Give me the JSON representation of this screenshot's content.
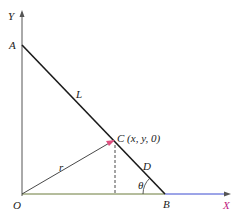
{
  "diagram": {
    "labels": {
      "y_axis": "Y",
      "x_axis": "X",
      "origin": "O",
      "point_a": "A",
      "point_b": "B",
      "point_c": "C (x, y, 0)",
      "segment_l": "L",
      "segment_d": "D",
      "vector_r": "r",
      "angle": "θ"
    },
    "colors": {
      "axis_y": "#555555",
      "axis_x_left": "#6b7a3a",
      "axis_x_right": "#3a4ad0",
      "line_ab": "#1a1a1a",
      "vector": "#333333",
      "x_label": "#c02080",
      "arrow_tip_c": "#e05080"
    }
  }
}
